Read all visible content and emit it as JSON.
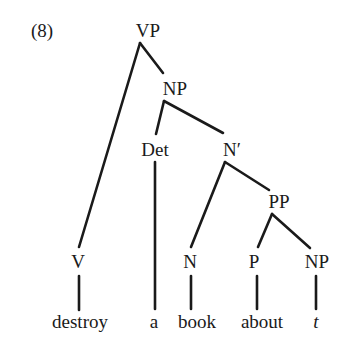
{
  "example_number": "(8)",
  "tree": {
    "nodes": [
      {
        "id": "VP",
        "label": "VP",
        "x": 148,
        "y": 37
      },
      {
        "id": "NP1",
        "label": "NP",
        "x": 175,
        "y": 95
      },
      {
        "id": "Det",
        "label": "Det",
        "x": 155,
        "y": 156
      },
      {
        "id": "Nbar",
        "label": "N′",
        "x": 232,
        "y": 156
      },
      {
        "id": "PP",
        "label": "PP",
        "x": 279,
        "y": 208
      },
      {
        "id": "V",
        "label": "V",
        "x": 78,
        "y": 268
      },
      {
        "id": "N",
        "label": "N",
        "x": 190,
        "y": 268
      },
      {
        "id": "P",
        "label": "P",
        "x": 254,
        "y": 268
      },
      {
        "id": "NP2",
        "label": "NP",
        "x": 317,
        "y": 268
      }
    ],
    "words": [
      {
        "text": "destroy",
        "x": 80,
        "y": 328,
        "italic": false
      },
      {
        "text": "a",
        "x": 154,
        "y": 328,
        "italic": false
      },
      {
        "text": "book",
        "x": 197,
        "y": 328,
        "italic": false
      },
      {
        "text": "about",
        "x": 262,
        "y": 328,
        "italic": false
      },
      {
        "text": "t",
        "x": 316,
        "y": 328,
        "italic": true
      }
    ],
    "edges": [
      {
        "from": "VP",
        "to": "V",
        "x1": 140,
        "y1": 43,
        "x2": 79,
        "y2": 247
      },
      {
        "from": "VP",
        "to": "NP1",
        "x1": 140,
        "y1": 43,
        "x2": 163,
        "y2": 73
      },
      {
        "from": "NP1",
        "to": "Det",
        "x1": 164,
        "y1": 101,
        "x2": 156,
        "y2": 134
      },
      {
        "from": "NP1",
        "to": "Nbar",
        "x1": 164,
        "y1": 101,
        "x2": 223,
        "y2": 133
      },
      {
        "from": "Det",
        "to": "a",
        "x1": 155,
        "y1": 162,
        "x2": 155,
        "y2": 309
      },
      {
        "from": "Nbar",
        "to": "N",
        "x1": 225,
        "y1": 162,
        "x2": 191,
        "y2": 247
      },
      {
        "from": "Nbar",
        "to": "PP",
        "x1": 225,
        "y1": 162,
        "x2": 269,
        "y2": 190
      },
      {
        "from": "PP",
        "to": "P",
        "x1": 272,
        "y1": 214,
        "x2": 258,
        "y2": 247
      },
      {
        "from": "PP",
        "to": "NP2",
        "x1": 272,
        "y1": 214,
        "x2": 310,
        "y2": 248
      },
      {
        "from": "V",
        "to": "destroy",
        "x1": 79,
        "y1": 276,
        "x2": 79,
        "y2": 310
      },
      {
        "from": "N",
        "to": "book",
        "x1": 191,
        "y1": 276,
        "x2": 191,
        "y2": 309
      },
      {
        "from": "P",
        "to": "about",
        "x1": 257,
        "y1": 276,
        "x2": 257,
        "y2": 309
      },
      {
        "from": "NP2",
        "to": "t",
        "x1": 316,
        "y1": 276,
        "x2": 316,
        "y2": 309
      }
    ]
  }
}
